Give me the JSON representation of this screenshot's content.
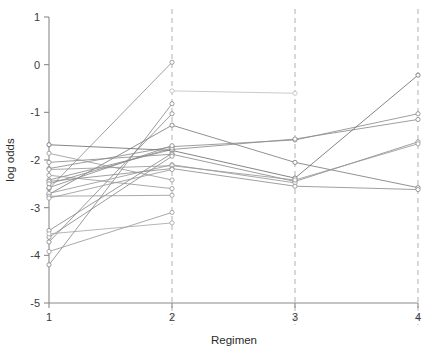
{
  "chart_data": {
    "type": "line",
    "title": "",
    "subtitle": "",
    "xlabel": "Regimen",
    "ylabel": "log odds",
    "x": [
      1,
      2,
      3,
      4
    ],
    "xtick_labels": [
      "1",
      "2",
      "3",
      "4"
    ],
    "ytick_labels": [
      "1",
      "0",
      "-1",
      "-2",
      "-3",
      "-4",
      "-5"
    ],
    "ytick_values": [
      1,
      0,
      -1,
      -2,
      -3,
      -4,
      -5
    ],
    "xlim": [
      1,
      4
    ],
    "ylim": [
      -5,
      1
    ],
    "grid": false,
    "legend": "none",
    "reference_lines_x": [
      2,
      3,
      4
    ],
    "marker": "open-circle",
    "series": [
      {
        "name": "subject-01",
        "x": [
          1,
          2
        ],
        "values": [
          -2.6,
          0.05
        ],
        "color": "#8f8f8f"
      },
      {
        "name": "subject-02",
        "x": [
          2,
          3
        ],
        "values": [
          -0.55,
          -0.6
        ],
        "color": "#c0c0c0"
      },
      {
        "name": "subject-03",
        "x": [
          1,
          2
        ],
        "values": [
          -4.2,
          -0.82
        ],
        "color": "#8a8a8a"
      },
      {
        "name": "subject-04",
        "x": [
          1,
          2
        ],
        "values": [
          -3.72,
          -1.03
        ],
        "color": "#8a8a8a"
      },
      {
        "name": "subject-05",
        "x": [
          1,
          2,
          3,
          4
        ],
        "values": [
          -2.72,
          -1.27,
          -2.05,
          -2.58
        ],
        "color": "#7d7d7d"
      },
      {
        "name": "subject-06",
        "x": [
          1,
          2,
          3,
          4
        ],
        "values": [
          -2.18,
          -1.72,
          -1.58,
          -1.03
        ],
        "color": "#8c8c8c"
      },
      {
        "name": "subject-07",
        "x": [
          1,
          2,
          3,
          4
        ],
        "values": [
          -2.42,
          -1.78,
          -1.56,
          -1.15
        ],
        "color": "#8c8c8c"
      },
      {
        "name": "subject-08",
        "x": [
          1,
          2,
          3,
          4
        ],
        "values": [
          -1.68,
          -1.8,
          -2.38,
          -0.22
        ],
        "color": "#6f6f6f"
      },
      {
        "name": "subject-09",
        "x": [
          1,
          2
        ],
        "values": [
          -3.48,
          -1.86
        ],
        "color": "#8a8a8a"
      },
      {
        "name": "subject-10",
        "x": [
          1,
          2,
          3,
          4
        ],
        "values": [
          -2.05,
          -1.88,
          -2.45,
          -1.62
        ],
        "color": "#8c8c8c"
      },
      {
        "name": "subject-11",
        "x": [
          1,
          2
        ],
        "values": [
          -3.62,
          -1.92
        ],
        "color": "#8a8a8a"
      },
      {
        "name": "subject-12",
        "x": [
          1,
          2,
          3
        ],
        "values": [
          -2.7,
          -2.1,
          -2.48
        ],
        "color": "#9a9a9a"
      },
      {
        "name": "subject-13",
        "x": [
          1,
          2,
          3,
          4
        ],
        "values": [
          -2.2,
          -2.12,
          -2.42,
          -1.66
        ],
        "color": "#9a9a9a"
      },
      {
        "name": "subject-14",
        "x": [
          1,
          2,
          3,
          4
        ],
        "values": [
          -2.45,
          -2.18,
          -2.55,
          -2.62
        ],
        "color": "#8f8f8f"
      },
      {
        "name": "subject-15",
        "x": [
          1,
          2
        ],
        "values": [
          -1.86,
          -2.42
        ],
        "color": "#9a9a9a"
      },
      {
        "name": "subject-16",
        "x": [
          1,
          2
        ],
        "values": [
          -2.32,
          -2.6
        ],
        "color": "#9a9a9a"
      },
      {
        "name": "subject-17",
        "x": [
          1,
          2
        ],
        "values": [
          -2.76,
          -2.74
        ],
        "color": "#9a9a9a"
      },
      {
        "name": "subject-18",
        "x": [
          1,
          2
        ],
        "values": [
          -3.92,
          -3.1
        ],
        "color": "#9a9a9a"
      },
      {
        "name": "subject-19",
        "x": [
          1,
          2
        ],
        "values": [
          -3.55,
          -3.32
        ],
        "color": "#a8a8a8"
      },
      {
        "name": "subject-20",
        "x": [
          1,
          2
        ],
        "values": [
          -2.5,
          -1.75
        ],
        "color": "#8c8c8c"
      },
      {
        "name": "subject-21",
        "x": [
          1,
          2
        ],
        "values": [
          -2.58,
          -1.7
        ],
        "color": "#8c8c8c"
      },
      {
        "name": "subject-22",
        "x": [
          1,
          2
        ],
        "values": [
          -2.8,
          -2.2
        ],
        "color": "#9a9a9a"
      }
    ]
  },
  "axes": {
    "y_title": "log odds",
    "x_title": "Regimen"
  },
  "colors": {
    "axis": "#8a8a8a",
    "reference": "#b9b9b9",
    "text": "#2b2b2b",
    "background": "#ffffff"
  }
}
